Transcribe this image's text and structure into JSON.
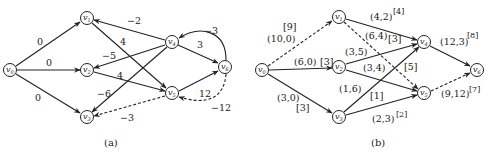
{
  "figure_a": {
    "caption": "(a)",
    "nodes": [
      {
        "id": "v0",
        "base": "v",
        "sub": "0",
        "x": 10,
        "y": 70
      },
      {
        "id": "v1",
        "base": "v",
        "sub": "1",
        "x": 87,
        "y": 18
      },
      {
        "id": "v2",
        "base": "v",
        "sub": "2",
        "x": 87,
        "y": 70
      },
      {
        "id": "v3",
        "base": "v",
        "sub": "3",
        "x": 87,
        "y": 117
      },
      {
        "id": "v4",
        "base": "v",
        "sub": "4",
        "x": 172,
        "y": 42
      },
      {
        "id": "v5",
        "base": "v",
        "sub": "5",
        "x": 172,
        "y": 93
      },
      {
        "id": "v6",
        "base": "v",
        "sub": "6",
        "x": 225,
        "y": 67
      }
    ],
    "edges": [
      {
        "from": "v0",
        "to": "v1",
        "weight": "0",
        "style": "solid"
      },
      {
        "from": "v0",
        "to": "v2",
        "weight": "0",
        "style": "solid"
      },
      {
        "from": "v0",
        "to": "v3",
        "weight": "0",
        "style": "solid"
      },
      {
        "from": "v4",
        "to": "v1",
        "weight": "−2",
        "style": "solid"
      },
      {
        "from": "v1",
        "to": "v5",
        "weight": "4",
        "style": "solid"
      },
      {
        "from": "v4",
        "to": "v2",
        "weight": "−5",
        "style": "solid"
      },
      {
        "from": "v2",
        "to": "v5",
        "weight": "4",
        "style": "solid"
      },
      {
        "from": "v4",
        "to": "v3",
        "weight": "−6",
        "style": "solid"
      },
      {
        "from": "v4",
        "to": "v6",
        "weight": "3",
        "style": "solid"
      },
      {
        "from": "v6",
        "to": "v4",
        "weight": "−3",
        "style": "solid",
        "curved": true
      },
      {
        "from": "v5",
        "to": "v6",
        "weight": "12",
        "style": "solid"
      },
      {
        "from": "v6",
        "to": "v5",
        "weight": "−12",
        "style": "dashed",
        "curved": true
      },
      {
        "from": "v5",
        "to": "v3",
        "weight": "−3",
        "style": "dashed"
      }
    ]
  },
  "figure_b": {
    "caption": "(b)",
    "nodes": [
      {
        "id": "v0",
        "base": "v",
        "sub": "0",
        "x": 262,
        "y": 70
      },
      {
        "id": "v1",
        "base": "v",
        "sub": "1",
        "x": 339,
        "y": 17
      },
      {
        "id": "v2",
        "base": "v",
        "sub": "2",
        "x": 339,
        "y": 67
      },
      {
        "id": "v3",
        "base": "v",
        "sub": "3",
        "x": 339,
        "y": 117
      },
      {
        "id": "v4",
        "base": "v",
        "sub": "4",
        "x": 424,
        "y": 42
      },
      {
        "id": "v5",
        "base": "v",
        "sub": "5",
        "x": 424,
        "y": 93
      },
      {
        "id": "v6",
        "base": "v",
        "sub": "6",
        "x": 477,
        "y": 70
      }
    ],
    "edges": [
      {
        "from": "v0",
        "to": "v1",
        "label": "(10,0)",
        "bracket": "[9]",
        "style": "dashed"
      },
      {
        "from": "v0",
        "to": "v2",
        "label": "(6,0)",
        "bracket": "[3]",
        "style": "solid"
      },
      {
        "from": "v0",
        "to": "v3",
        "label": "(3,0)",
        "bracket": "[3]",
        "style": "solid"
      },
      {
        "from": "v1",
        "to": "v4",
        "label": "(4,2)",
        "bracket": "[4]",
        "style": "solid"
      },
      {
        "from": "v1",
        "to": "v5",
        "label": "(6,4)",
        "bracket": "[3]",
        "style": "dashed"
      },
      {
        "from": "v2",
        "to": "v4",
        "label": "(3,5)",
        "bracket": "[5]",
        "style": "solid"
      },
      {
        "from": "v2",
        "to": "v5",
        "label": "(3,4)",
        "bracket": "",
        "style": "solid"
      },
      {
        "from": "v3",
        "to": "v4",
        "label": "(1,6)",
        "bracket": "[1]",
        "style": "solid"
      },
      {
        "from": "v3",
        "to": "v5",
        "label": "(2,3)",
        "bracket": "[2]",
        "style": "solid"
      },
      {
        "from": "v4",
        "to": "v6",
        "label": "(12,3)",
        "bracket": "[8]",
        "style": "solid"
      },
      {
        "from": "v5",
        "to": "v6",
        "label": "(9,12)",
        "bracket": "[7]",
        "style": "dashed"
      }
    ]
  }
}
